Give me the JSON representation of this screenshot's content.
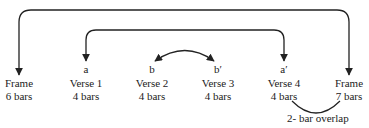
{
  "sections": [
    {
      "name": "Frame",
      "bars": "6 bars",
      "letter": "",
      "x": 19
    },
    {
      "name": "Verse 1",
      "bars": "4 bars",
      "letter": "a",
      "x": 86
    },
    {
      "name": "Verse 2",
      "bars": "4 bars",
      "letter": "b",
      "x": 152
    },
    {
      "name": "Verse 3",
      "bars": "4 bars",
      "letter": "b′",
      "x": 218
    },
    {
      "name": "Verse 4",
      "bars": "4 bars",
      "letter": "a′",
      "x": 284
    },
    {
      "name": "Frame",
      "bars": "7 bars",
      "letter": "",
      "x": 349
    }
  ],
  "connections": [
    {
      "from": "Frame (6 bars)",
      "to": "Frame (7 bars)",
      "type": "bidirectional-bracket",
      "level": "outer"
    },
    {
      "from": "a",
      "to": "a′",
      "type": "bidirectional-bracket",
      "level": "inner"
    },
    {
      "from": "b",
      "to": "b′",
      "type": "bidirectional-arc"
    }
  ],
  "overlap_note": "2- bar overlap",
  "colors": {
    "line": "#222222",
    "text": "#222222",
    "background": "#ffffff"
  }
}
